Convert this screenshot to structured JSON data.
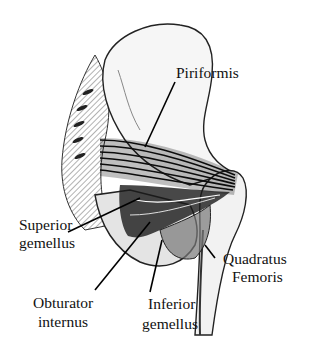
{
  "figure": {
    "labels": {
      "piriformis": "Piriformis",
      "superior_gemellus_line1": "Superior",
      "superior_gemellus_line2": "gemellus",
      "quadratus_femoris_line1": "Quadratus",
      "quadratus_femoris_line2": "Femoris",
      "obturator_internus_line1": "Obturator",
      "obturator_internus_line2": "internus",
      "inferior_gemellus_line1": "Inferior",
      "inferior_gemellus_line2": "gemellus"
    },
    "colors": {
      "ink": "#111111",
      "background": "#ffffff",
      "shade": "#555555"
    }
  }
}
